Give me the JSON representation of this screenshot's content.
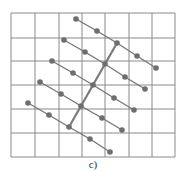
{
  "figure": {
    "label": "c)",
    "colors": {
      "grid": "#8a8a8a",
      "chain": "#777777",
      "dot": "#6e6e6e",
      "spine": "#7a7a7a"
    },
    "grid": {
      "x": [
        11,
        35,
        59,
        82,
        105,
        129,
        152,
        175
      ],
      "y": [
        13,
        38,
        61,
        85,
        109,
        133,
        157
      ]
    },
    "chains": [
      [
        [
          76,
          19
        ],
        [
          97,
          31
        ],
        [
          117,
          43
        ],
        [
          137,
          56
        ],
        [
          156,
          68
        ]
      ],
      [
        [
          64,
          40
        ],
        [
          85,
          52
        ],
        [
          105,
          64
        ],
        [
          125,
          77
        ],
        [
          145,
          89
        ]
      ],
      [
        [
          52,
          61
        ],
        [
          73,
          73
        ],
        [
          93,
          85
        ],
        [
          114,
          98
        ],
        [
          134,
          110
        ]
      ],
      [
        [
          40,
          82
        ],
        [
          61,
          94
        ],
        [
          81,
          106
        ],
        [
          102,
          118
        ],
        [
          122,
          130
        ]
      ],
      [
        [
          28,
          103
        ],
        [
          49,
          115
        ],
        [
          69,
          127
        ],
        [
          90,
          139
        ],
        [
          110,
          152
        ]
      ]
    ],
    "spine": [
      [
        117,
        43
      ],
      [
        105,
        64
      ],
      [
        93,
        85
      ],
      [
        81,
        106
      ],
      [
        69,
        127
      ]
    ]
  }
}
